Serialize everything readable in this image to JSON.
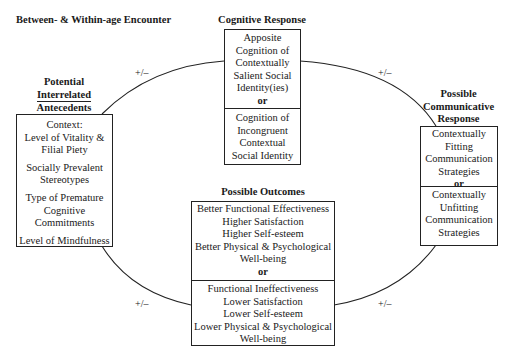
{
  "header": {
    "title": "Between- & Within-age Encounter"
  },
  "connector_label": "+/–",
  "antecedents": {
    "title_lines": [
      "Potential",
      "Interrelated",
      "Antecedents"
    ],
    "items": [
      {
        "lines": [
          "Context:",
          "Level of Vitality &",
          "Filial Piety"
        ]
      },
      {
        "lines": [
          "Socially Prevalent",
          "Stereotypes"
        ]
      },
      {
        "lines": [
          "Type of Premature",
          "Cognitive",
          "Commitments"
        ]
      },
      {
        "lines": [
          "Level of Mindfulness"
        ]
      }
    ]
  },
  "cognitive": {
    "title": "Cognitive Response",
    "option_a": [
      "Apposite",
      "Cognition of",
      "Contextually",
      "Salient Social",
      "Identity(ies)"
    ],
    "or": "or",
    "option_b": [
      "Cognition of",
      "Incongruent",
      "Contextual",
      "Social Identity"
    ]
  },
  "communicative": {
    "title_lines": [
      "Possible",
      "Communicative",
      "Response"
    ],
    "option_a": [
      "Contextually",
      "Fitting",
      "Communication",
      "Strategies"
    ],
    "or": "or",
    "option_b": [
      "Contextually",
      "Unfitting",
      "Communication",
      "Strategies"
    ]
  },
  "outcomes": {
    "title": "Possible Outcomes",
    "option_a": [
      "Better Functional Effectiveness",
      "Higher Satisfaction",
      "Higher Self-esteem",
      "Better Physical & Psychological",
      "Well-being"
    ],
    "or": "or",
    "option_b": [
      "Functional Ineffectiveness",
      "Lower Satisfaction",
      "Lower Self-esteem",
      "Lower Physical & Psychological",
      "Well-being"
    ]
  }
}
